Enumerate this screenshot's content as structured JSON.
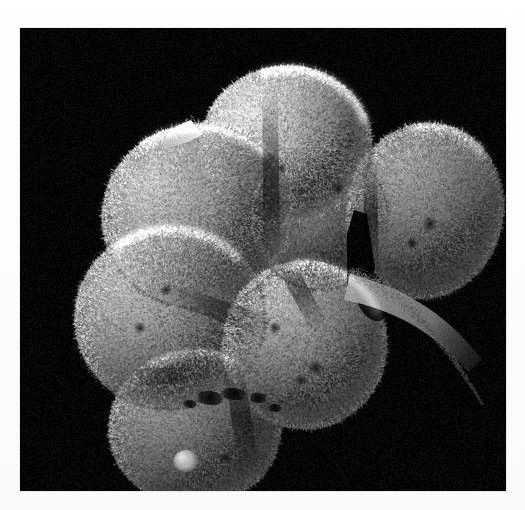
{
  "page": {
    "background_color": "#fdfdfd",
    "margin_color": "#ffffff",
    "width": 525,
    "height": 510
  },
  "micrograph": {
    "kind": "scanning-electron-micrograph",
    "subject": "early-stage mammalian embryo (compacting morula / 8-cell stage)",
    "background_color": "#050505",
    "plate": {
      "x": 20,
      "y": 28,
      "width": 486,
      "height": 463
    },
    "tone": {
      "shadow": "#070707",
      "midtone": "#7b7b7b",
      "highlight": "#e8e8e8",
      "specular": "#f6f6f6"
    },
    "illumination": {
      "direction": "upper-left",
      "type": "directional-SEM"
    },
    "surface_texture": "dense short microvilli covering every blastomere, giving a fuzzy / granular rind",
    "caption": "",
    "blastomeres": [
      {
        "id": "cell-top",
        "label": "top blastomere",
        "cx": 266,
        "cy": 118,
        "rx": 86,
        "ry": 80,
        "rotation": -8,
        "brightness": 0.94,
        "note": "brightest cell, upper centre, fully lit crown"
      },
      {
        "id": "cell-upper-left",
        "label": "upper-left blastomere",
        "cx": 178,
        "cy": 188,
        "rx": 96,
        "ry": 92,
        "rotation": -14,
        "brightness": 0.8,
        "note": "large left cell, bright rim with shaded lower-right flank"
      },
      {
        "id": "cell-right",
        "label": "right blastomere",
        "cx": 405,
        "cy": 183,
        "rx": 78,
        "ry": 88,
        "rotation": 12,
        "brightness": 0.62,
        "note": "right-hand cell, strongly shadowed core, bright upper edge"
      },
      {
        "id": "cell-middle",
        "label": "middle blastomere (behind)",
        "cx": 300,
        "cy": 190,
        "rx": 68,
        "ry": 72,
        "rotation": 0,
        "brightness": 0.55,
        "note": "recessed cell between the top and right cells"
      },
      {
        "id": "cell-left-lower",
        "label": "lower-left blastomere",
        "cx": 150,
        "cy": 290,
        "rx": 95,
        "ry": 92,
        "rotation": -6,
        "brightness": 0.76,
        "note": "prominent foreground cell, lower left"
      },
      {
        "id": "cell-centre-front",
        "label": "centre-front blastomere",
        "cx": 285,
        "cy": 317,
        "rx": 82,
        "ry": 84,
        "rotation": 4,
        "brightness": 0.7,
        "note": "front centre cell with pitted surface"
      },
      {
        "id": "cell-bottom",
        "label": "bottom blastomere",
        "cx": 175,
        "cy": 400,
        "rx": 86,
        "ry": 78,
        "rotation": -4,
        "brightness": 0.58,
        "note": "lowest cell, shadowed, shows a small bright bleb"
      }
    ],
    "features": [
      {
        "id": "spike-upper-left",
        "label": "cytoplasmic projection",
        "x": 168,
        "y": 100,
        "note": "thin finger-like projection pointing up-left from the top cell"
      },
      {
        "id": "dark-cleft",
        "label": "intercellular cleft",
        "x": 340,
        "y": 220,
        "note": "deep wedge-shaped dark gap between middle and right cells"
      },
      {
        "id": "tail-lower-right",
        "label": "tapering cytoplasmic tail",
        "x": 415,
        "y": 300,
        "note": "narrow tapering strand running toward the lower right"
      },
      {
        "id": "bleb-bottom",
        "label": "surface bleb",
        "x": 165,
        "y": 433,
        "note": "small smooth bright rounded bleb on the bottom cell"
      },
      {
        "id": "dark-pits",
        "label": "surface pits",
        "x": 205,
        "y": 375,
        "note": "cluster of dark pits / pores on the bottom cell"
      }
    ]
  }
}
